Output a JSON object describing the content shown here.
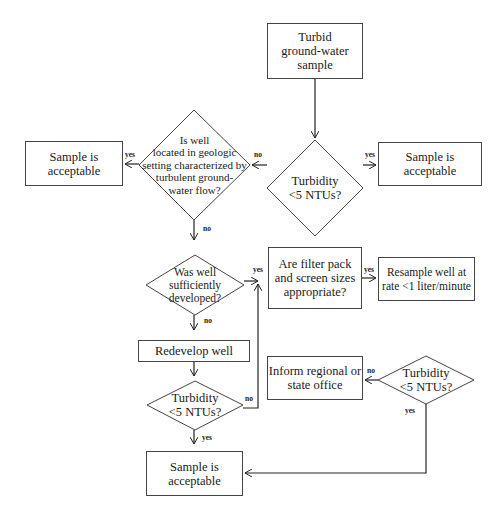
{
  "diagram": {
    "type": "flowchart",
    "nodes": {
      "start": {
        "text": "Turbid ground-water sample",
        "lines": [
          "Turbid",
          "ground-water",
          "sample"
        ]
      },
      "turbidity_1": {
        "lines": [
          "Turbidity",
          "<5 NTUs?"
        ]
      },
      "accept_right": {
        "lines": [
          "Sample is",
          "acceptable"
        ]
      },
      "geologic": {
        "lines": [
          "Is well",
          "located in geologic",
          "setting characterized by",
          "turbulent ground-",
          "water flow?"
        ]
      },
      "accept_left": {
        "lines": [
          "Sample is",
          "acceptable"
        ]
      },
      "developed": {
        "lines": [
          "Was well",
          "sufficiently",
          "developed?"
        ]
      },
      "filter_pack": {
        "lines": [
          "Are filter pack",
          "and screen sizes",
          "appropriate?"
        ]
      },
      "resample": {
        "lines": [
          "Resample well at",
          "rate <1 liter/minute"
        ]
      },
      "redevelop": {
        "lines": [
          "Redevelop well"
        ]
      },
      "turbidity_2": {
        "lines": [
          "Turbidity",
          "<5 NTUs?"
        ]
      },
      "inform": {
        "lines": [
          "Inform regional or",
          "state office"
        ]
      },
      "turbidity_3": {
        "lines": [
          "Turbidity",
          "<5 NTUs?"
        ]
      },
      "accept_bottom": {
        "lines": [
          "Sample is",
          "acceptable"
        ]
      }
    },
    "edge_labels": {
      "t1_yes": "yes",
      "t1_no": "no",
      "geo_yes": "yes",
      "geo_no": "no",
      "dev_yes": "yes",
      "dev_no": "no",
      "filter_yes": "yes",
      "t2_no": "no",
      "t2_yes": "yes",
      "t3_no": "no",
      "t3_yes": "yes"
    }
  }
}
